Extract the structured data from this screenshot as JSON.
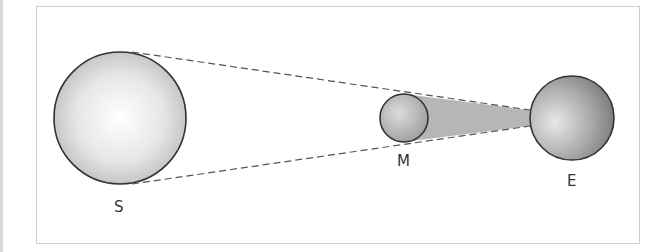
{
  "diagram": {
    "type": "solar-eclipse-geometry",
    "bodies": [
      {
        "id": "sun",
        "label": "S",
        "cx": 120,
        "cy": 118,
        "r": 66
      },
      {
        "id": "moon",
        "label": "M",
        "cx": 404,
        "cy": 118,
        "r": 24
      },
      {
        "id": "earth",
        "label": "E",
        "cx": 572,
        "cy": 118,
        "r": 42
      }
    ],
    "colors": {
      "outline": "#333333",
      "dashed": "#555555",
      "shadow": "#a9a9a9",
      "frame": "#cfcfcf"
    }
  }
}
